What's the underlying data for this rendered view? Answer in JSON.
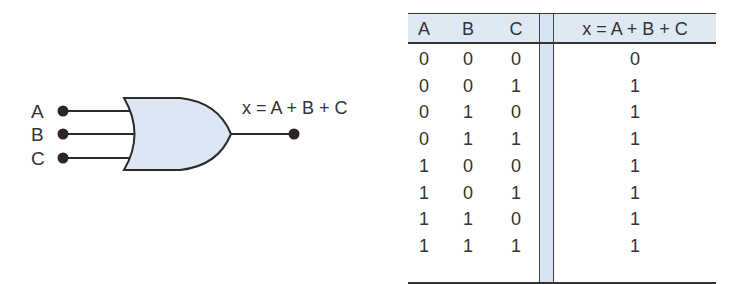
{
  "diagram": {
    "type": "OR gate",
    "inputs": [
      "A",
      "B",
      "C"
    ],
    "output_expression": "x = A + B + C",
    "colors": {
      "gate_fill": "#dce7f3",
      "line": "#2b2b2b",
      "terminal": "#2e2422",
      "table_header_bg": "#dfe9f4",
      "divider_bg": "#d7e4f3"
    }
  },
  "truth_table": {
    "headers": [
      "A",
      "B",
      "C",
      "x = A + B + C"
    ],
    "rows": [
      [
        "0",
        "0",
        "0",
        "0"
      ],
      [
        "0",
        "0",
        "1",
        "1"
      ],
      [
        "0",
        "1",
        "0",
        "1"
      ],
      [
        "0",
        "1",
        "1",
        "1"
      ],
      [
        "1",
        "0",
        "0",
        "1"
      ],
      [
        "1",
        "0",
        "1",
        "1"
      ],
      [
        "1",
        "1",
        "0",
        "1"
      ],
      [
        "1",
        "1",
        "1",
        "1"
      ]
    ]
  }
}
